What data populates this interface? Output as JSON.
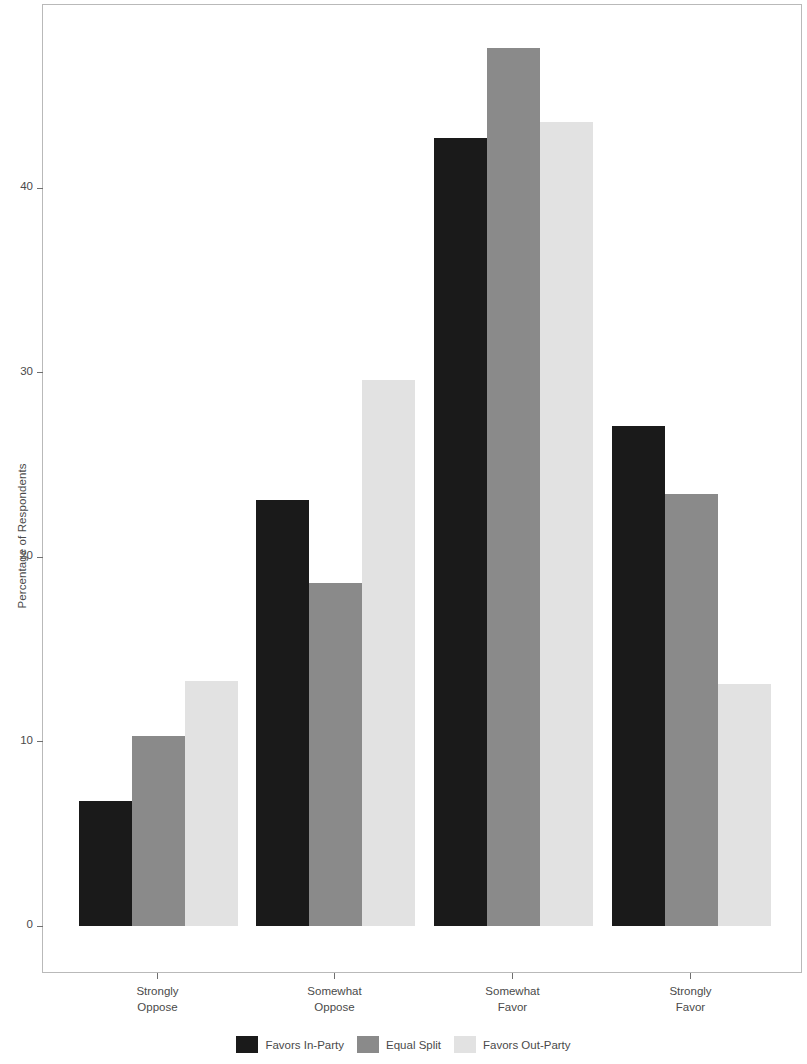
{
  "chart_data": {
    "type": "bar",
    "title": "",
    "subtitle": "",
    "xlabel": "",
    "ylabel": "Percentage of Respondents",
    "categories": [
      "Strongly\nOppose",
      "Somewhat\nOppose",
      "Somewhat\nFavor",
      "Strongly\nFavor"
    ],
    "category_lines": [
      [
        "Strongly",
        "Oppose"
      ],
      [
        "Somewhat",
        "Oppose"
      ],
      [
        "Somewhat",
        "Favor"
      ],
      [
        "Strongly",
        "Favor"
      ]
    ],
    "series": [
      {
        "name": "Favors In-Party",
        "color": "#1a1a1a",
        "values": [
          6.8,
          23.1,
          42.7,
          27.1
        ]
      },
      {
        "name": "Equal Split",
        "color": "#8a8a8a",
        "values": [
          10.3,
          18.6,
          47.6,
          23.4
        ]
      },
      {
        "name": "Favors Out-Party",
        "color": "#e2e2e2",
        "values": [
          13.3,
          29.6,
          43.6,
          13.1
        ]
      }
    ],
    "ylim": [
      0,
      51.5
    ],
    "yticks": [
      0,
      10,
      20,
      30,
      40
    ],
    "ytick_labels": [
      "0",
      "10",
      "20",
      "30",
      "40"
    ],
    "grid": false,
    "legend_position": "bottom",
    "legend_entries": [
      "Favors In-Party",
      "Equal Split",
      "Favors Out-Party"
    ]
  },
  "axes": {
    "y_title": "Percentage of Respondents"
  },
  "legend": {
    "entries": [
      {
        "label": "Favors In-Party"
      },
      {
        "label": "Equal Split"
      },
      {
        "label": "Favors Out-Party"
      }
    ]
  }
}
